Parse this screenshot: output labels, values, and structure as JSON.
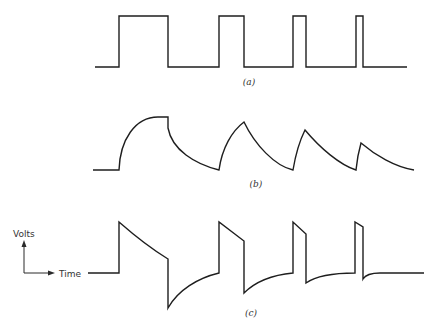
{
  "figure": {
    "panels": [
      {
        "id": "a",
        "caption": "(a)",
        "description": "Rectangular pulse train of decreasing width"
      },
      {
        "id": "b",
        "caption": "(b)",
        "description": "Integrated (RC low-pass) response to pulse train"
      },
      {
        "id": "c",
        "caption": "(c)",
        "description": "Differentiated (RC high-pass) response to pulse train"
      }
    ],
    "axes_indicator": {
      "y_label": "Volts",
      "x_label": "Time"
    }
  },
  "colors": {
    "stroke": "#1e1e1e",
    "background": "#ffffff"
  }
}
